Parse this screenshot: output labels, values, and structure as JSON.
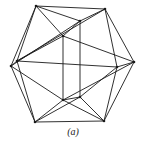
{
  "figure": {
    "caption": "(a)",
    "stroke_color": "#1a1a1a",
    "vertices": {
      "A": [
        36,
        6
      ],
      "B": [
        105,
        9
      ],
      "C": [
        80,
        21
      ],
      "D": [
        63,
        36
      ],
      "E": [
        11,
        66
      ],
      "F": [
        17,
        61
      ],
      "G": [
        134,
        62
      ],
      "H": [
        117,
        67
      ],
      "I": [
        63,
        100
      ],
      "J": [
        80,
        97
      ],
      "K": [
        35,
        122
      ],
      "L": [
        104,
        121
      ]
    },
    "edges": [
      [
        "A",
        "B"
      ],
      [
        "A",
        "C"
      ],
      [
        "A",
        "D"
      ],
      [
        "A",
        "E"
      ],
      [
        "A",
        "F"
      ],
      [
        "B",
        "C"
      ],
      [
        "B",
        "G"
      ],
      [
        "B",
        "H"
      ],
      [
        "B",
        "F"
      ],
      [
        "C",
        "D"
      ],
      [
        "C",
        "J"
      ],
      [
        "C",
        "E"
      ],
      [
        "D",
        "F"
      ],
      [
        "D",
        "I"
      ],
      [
        "D",
        "G"
      ],
      [
        "E",
        "F"
      ],
      [
        "E",
        "K"
      ],
      [
        "E",
        "I"
      ],
      [
        "F",
        "K"
      ],
      [
        "F",
        "H"
      ],
      [
        "G",
        "H"
      ],
      [
        "G",
        "L"
      ],
      [
        "G",
        "I"
      ],
      [
        "H",
        "J"
      ],
      [
        "H",
        "L"
      ],
      [
        "I",
        "K"
      ],
      [
        "I",
        "J"
      ],
      [
        "I",
        "L"
      ],
      [
        "J",
        "K"
      ],
      [
        "J",
        "L"
      ],
      [
        "K",
        "L"
      ]
    ]
  }
}
